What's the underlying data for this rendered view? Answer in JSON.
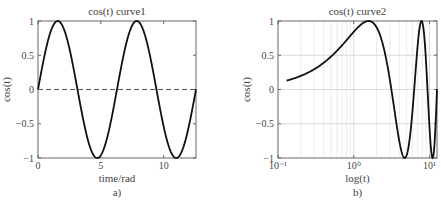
{
  "chart_data": [
    {
      "type": "line",
      "panel_label": "a)",
      "title": "cos(t) curve1",
      "xlabel": "time/rad",
      "ylabel": "cos(t)",
      "xlim": [
        0,
        12.57
      ],
      "ylim": [
        -1,
        1
      ],
      "xscale": "linear",
      "xticks": [
        0,
        5,
        10
      ],
      "xtick_labels": [
        "0",
        "5",
        "10"
      ],
      "yticks": [
        -1,
        -0.5,
        0,
        0.5,
        1
      ],
      "ytick_labels": [
        "−1",
        "−0.5",
        "0",
        "0.5",
        "1"
      ],
      "grid": false,
      "series": [
        {
          "name": "curve",
          "style": "solid",
          "color": "#111111",
          "function": "sin(t)",
          "x_range": [
            0,
            12.57
          ],
          "x": [
            0,
            1.571,
            3.142,
            4.712,
            6.283,
            7.854,
            9.425,
            10.996,
            12.566
          ],
          "y": [
            0,
            1,
            0,
            -1,
            0,
            1,
            0,
            -1,
            0
          ]
        },
        {
          "name": "zero line",
          "style": "dashed",
          "color": "#555555",
          "x": [
            0,
            12.57
          ],
          "y": [
            0,
            0
          ]
        }
      ]
    },
    {
      "type": "line",
      "panel_label": "b)",
      "title": "cos(t) curve2",
      "xlabel": "log(t)",
      "ylabel": "cos(t)",
      "xlim": [
        0.1,
        12.57
      ],
      "ylim": [
        -1,
        1
      ],
      "xscale": "log",
      "xticks": [
        0.1,
        1,
        10
      ],
      "xtick_labels": [
        "10⁻¹",
        "10⁰",
        "10¹"
      ],
      "yticks": [
        -1,
        -0.5,
        0,
        0.5,
        1
      ],
      "ytick_labels": [
        "−1",
        "−0.5",
        "0",
        "0.5",
        "1"
      ],
      "grid": true,
      "series": [
        {
          "name": "curve",
          "style": "solid",
          "color": "#111111",
          "function": "sin(t)",
          "x_range": [
            0.13,
            12.57
          ],
          "x": [
            0.13,
            0.3,
            0.5,
            1.0,
            1.571,
            3.142,
            4.712,
            6.283,
            7.854,
            9.425,
            10.996,
            12.566
          ],
          "y": [
            0.13,
            0.3,
            0.48,
            0.84,
            1,
            0,
            -1,
            0,
            1,
            0,
            -1,
            0
          ]
        }
      ]
    }
  ]
}
